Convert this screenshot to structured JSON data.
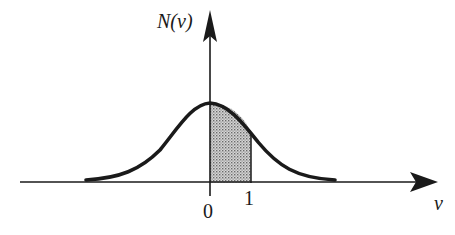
{
  "diagram": {
    "type": "normal-distribution-curve",
    "y_axis_label": "N(v)",
    "x_axis_label": "v",
    "tick_labels": [
      "0",
      "1"
    ],
    "shaded_region": {
      "from": "0",
      "to": "1",
      "pattern": "dotted-gray"
    },
    "colors": {
      "stroke": "#1a1a1a",
      "shade": "#b8b8b8",
      "background": "#ffffff"
    }
  }
}
